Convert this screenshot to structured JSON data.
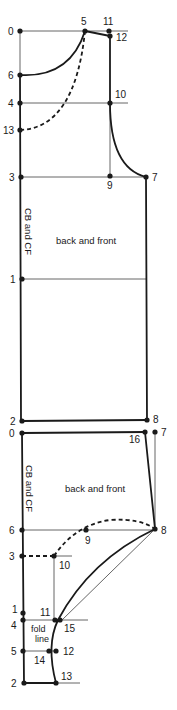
{
  "diagram": {
    "type": "sewing-pattern-draft",
    "colors": {
      "ink": "#1a1a1a",
      "construction": "#555555",
      "background": "#ffffff"
    },
    "pieces": [
      {
        "id": "bodice",
        "name": "back and front",
        "side_label": "CB and CF",
        "points": [
          {
            "label": "0",
            "x": 20,
            "y": 31
          },
          {
            "label": "5",
            "x": 85,
            "y": 31
          },
          {
            "label": "11",
            "x": 109,
            "y": 31
          },
          {
            "label": "12",
            "x": 110,
            "y": 36
          },
          {
            "label": "6",
            "x": 20,
            "y": 75
          },
          {
            "label": "4",
            "x": 20,
            "y": 103
          },
          {
            "label": "10",
            "x": 110,
            "y": 103
          },
          {
            "label": "13",
            "x": 20,
            "y": 130
          },
          {
            "label": "3",
            "x": 21,
            "y": 177
          },
          {
            "label": "9",
            "x": 110,
            "y": 176
          },
          {
            "label": "7",
            "x": 146,
            "y": 177
          },
          {
            "label": "1",
            "x": 22,
            "y": 279
          },
          {
            "label": "2",
            "x": 22,
            "y": 421
          },
          {
            "label": "8",
            "x": 147,
            "y": 420
          }
        ]
      },
      {
        "id": "sleeve",
        "name": "back and front",
        "side_label": "CB and CF",
        "fold_label_line1": "fold",
        "fold_label_line2": "line",
        "points": [
          {
            "label": "0",
            "x": 22,
            "y": 433
          },
          {
            "label": "16",
            "x": 145,
            "y": 432
          },
          {
            "label": "7",
            "x": 155,
            "y": 432
          },
          {
            "label": "6",
            "x": 22,
            "y": 530
          },
          {
            "label": "9",
            "x": 86,
            "y": 530
          },
          {
            "label": "8",
            "x": 155,
            "y": 529
          },
          {
            "label": "3",
            "x": 22,
            "y": 556
          },
          {
            "label": "10",
            "x": 54,
            "y": 556
          },
          {
            "label": "1",
            "x": 23,
            "y": 613
          },
          {
            "label": "4",
            "x": 23,
            "y": 620
          },
          {
            "label": "11",
            "x": 55,
            "y": 620
          },
          {
            "label": "15",
            "x": 60,
            "y": 620
          },
          {
            "label": "5",
            "x": 23,
            "y": 651
          },
          {
            "label": "14",
            "x": 49,
            "y": 651
          },
          {
            "label": "12",
            "x": 56,
            "y": 651
          },
          {
            "label": "2",
            "x": 24,
            "y": 683
          },
          {
            "label": "13",
            "x": 56,
            "y": 683
          }
        ]
      }
    ]
  },
  "labels": {
    "top": {
      "p0": "0",
      "p5": "5",
      "p11": "11",
      "p12": "12",
      "p6": "6",
      "p4": "4",
      "p10": "10",
      "p13": "13",
      "p3": "3",
      "p9": "9",
      "p7": "7",
      "p1": "1",
      "p2": "2",
      "p8": "8",
      "side": "CB and CF",
      "name": "back and front"
    },
    "bottom": {
      "p0": "0",
      "p16": "16",
      "p7": "7",
      "p6": "6",
      "p9": "9",
      "p8": "8",
      "p3": "3",
      "p10": "10",
      "p1": "1",
      "p4": "4",
      "p11": "11",
      "p15": "15",
      "p5": "5",
      "p14": "14",
      "p12": "12",
      "p2": "2",
      "p13": "13",
      "side": "CB and CF",
      "name": "back and front",
      "fold1": "fold",
      "fold2": "line"
    }
  }
}
